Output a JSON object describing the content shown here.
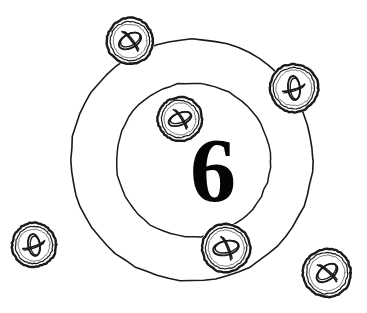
{
  "scene": {
    "title": "hand-drawn concentric circles with six buttons",
    "width": 367,
    "height": 313,
    "background_color": "#ffffff",
    "ink_color": "#1a1a1a"
  },
  "center_label": {
    "text": "6",
    "x": 213,
    "y": 168,
    "font_size": 92,
    "color": "#050505"
  },
  "rings": [
    {
      "name": "outer-ring",
      "cx": 192,
      "cy": 160,
      "r": 121,
      "stroke_width": 1.6
    },
    {
      "name": "inner-ring",
      "cx": 193,
      "cy": 160,
      "r": 77,
      "stroke_width": 1.5
    }
  ],
  "tokens": [
    {
      "id": "token-top-left",
      "label": "1",
      "cx": 130,
      "cy": 41,
      "r": 23,
      "glyph": "oval-slash-diagonal",
      "glyph_rotation": -28,
      "glyph_rx": 12,
      "glyph_ry": 7
    },
    {
      "id": "token-right",
      "label": "2",
      "cx": 294,
      "cy": 88,
      "r": 24,
      "glyph": "oval-slash-vertical",
      "glyph_rotation": 84,
      "glyph_rx": 12,
      "glyph_ry": 6
    },
    {
      "id": "token-bottom-right",
      "label": "3",
      "cx": 327,
      "cy": 273,
      "r": 24,
      "glyph": "oval-slash-diagonal",
      "glyph_rotation": -38,
      "glyph_rx": 12,
      "glyph_ry": 7
    },
    {
      "id": "token-bottom-center",
      "label": "4",
      "cx": 226,
      "cy": 248,
      "r": 24,
      "glyph": "oval-slash-horizontal",
      "glyph_rotation": -12,
      "glyph_rx": 13,
      "glyph_ry": 7
    },
    {
      "id": "token-inner-top",
      "label": "5",
      "cx": 180,
      "cy": 119,
      "r": 22,
      "glyph": "oval-slash-diagonal",
      "glyph_rotation": -22,
      "glyph_rx": 12,
      "glyph_ry": 6
    },
    {
      "id": "token-far-left",
      "label": "6",
      "cx": 34,
      "cy": 245,
      "r": 22,
      "glyph": "oval-slash-vertical",
      "glyph_rotation": 82,
      "glyph_rx": 11,
      "glyph_ry": 6
    }
  ]
}
